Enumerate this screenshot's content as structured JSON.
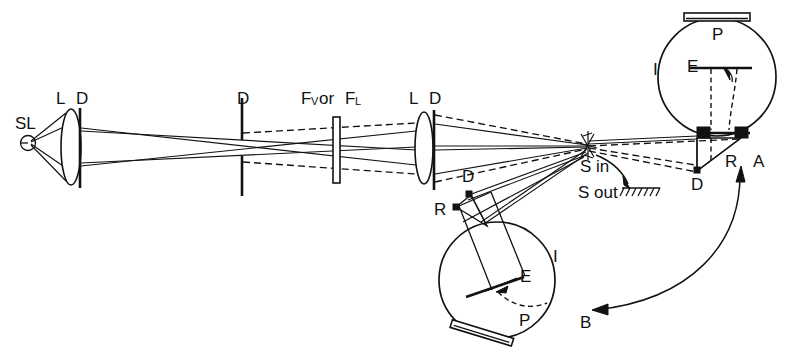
{
  "figure": {
    "background_color": "#ffffff",
    "ink_color": "#121212",
    "width": 795,
    "height": 364
  },
  "labels": {
    "source": "SL",
    "lens1": "L",
    "diaphragm1": "D",
    "diaphragm2": "D",
    "filter_main": "F",
    "filter_sub1": "V",
    "filter_or": "or",
    "filter_main2": "F",
    "filter_sub2": "L",
    "lens2": "L",
    "diaphragm3": "D",
    "sample_in": "S in",
    "sample_out": "S out",
    "sphere_top_port": "P",
    "sphere_top_baffle": "E",
    "sphere_top_interior": "I",
    "mirror_top": "R",
    "diaphragm_top": "D",
    "position_a": "A",
    "sphere_bottom_port": "P",
    "sphere_bottom_baffle": "E",
    "sphere_bottom_interior": "I",
    "mirror_bottom": "R",
    "diaphragm_bottom": "D",
    "position_b": "B"
  },
  "legend_meanings": {
    "SL": "source lamp",
    "L": "lens",
    "D": "diaphragm",
    "F_V": "visual filter",
    "F_L": "other filter",
    "S in": "sample in beam",
    "S out": "sample out of beam",
    "P": "photodetector port",
    "E": "baffle / screen",
    "I": "integrating sphere",
    "R": "reflecting mirror",
    "A": "sphere position A",
    "B": "sphere position B"
  },
  "components": {
    "source": {
      "cx": 28,
      "cy": 143,
      "r": 7
    },
    "lens1": {
      "cx": 71,
      "cy": 147,
      "rx": 10,
      "ry": 38
    },
    "diaphragm1": {
      "x": 80,
      "y1": 108,
      "y2": 188
    },
    "diaphragm2": {
      "x": 242,
      "y1": 98,
      "y2": 136,
      "y3": 160,
      "y4": 196
    },
    "filter": {
      "x": 333,
      "y": 117,
      "w": 7,
      "h": 66
    },
    "lens2": {
      "cx": 424,
      "cy": 148,
      "rx": 9,
      "ry": 36
    },
    "diaphragm3": {
      "x": 434,
      "y1": 110,
      "y2": 190
    },
    "sample_point": {
      "x": 588,
      "y": 146
    },
    "sphere_top": {
      "cx": 717,
      "cy": 77,
      "r": 59
    },
    "sphere_bottom": {
      "cx": 497,
      "cy": 280,
      "r": 58
    }
  }
}
